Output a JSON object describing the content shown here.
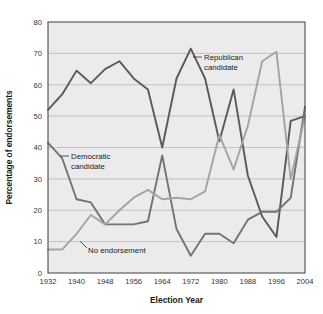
{
  "chart_data": {
    "type": "line",
    "title": "",
    "xlabel": "Election Year",
    "ylabel": "Percentage of endorsements",
    "xlim": [
      1932,
      2004
    ],
    "ylim": [
      0,
      80
    ],
    "grid": true,
    "legend_position": "inline-annotations",
    "x": [
      1932,
      1936,
      1940,
      1944,
      1948,
      1952,
      1956,
      1960,
      1964,
      1968,
      1972,
      1976,
      1980,
      1984,
      1988,
      1992,
      1996,
      2000,
      2004
    ],
    "xticks": [
      1932,
      1940,
      1948,
      1956,
      1964,
      1972,
      1980,
      1988,
      1996,
      2004
    ],
    "yticks": [
      0,
      10,
      20,
      30,
      40,
      50,
      60,
      70,
      80
    ],
    "series": [
      {
        "name": "Republican candidate",
        "color": "#595959",
        "values": [
          52,
          57,
          64.5,
          60.5,
          65,
          67.5,
          62,
          58.5,
          40,
          62,
          71.5,
          62,
          42,
          58.5,
          31,
          18,
          11.5,
          48.5,
          50
        ]
      },
      {
        "name": "Democratic candidate",
        "color": "#737373",
        "values": [
          41.5,
          36.5,
          23.5,
          22.5,
          15.5,
          15.5,
          15.5,
          16.5,
          37.5,
          14,
          5.5,
          12.5,
          12.5,
          9.5,
          17,
          19.5,
          19.5,
          24,
          53
        ]
      },
      {
        "name": "No endorsement",
        "color": "#a3a3a3",
        "values": [
          7.5,
          7.5,
          12.5,
          18.5,
          15.5,
          20,
          24,
          26.5,
          23.5,
          24,
          23.5,
          26,
          44,
          33,
          47,
          67.5,
          70.5,
          30,
          50
        ]
      }
    ],
    "annotations": [
      {
        "id": "republican-annotation",
        "lines": [
          "Republican",
          "candidate"
        ],
        "text_x": 204,
        "text_y": 57,
        "leader": {
          "x1": 193,
          "y1": 57,
          "x2": 202,
          "y2": 57
        }
      },
      {
        "id": "democratic-annotation",
        "lines": [
          "Democratic",
          "candidate"
        ],
        "text_x": 71,
        "text_y": 156,
        "leader": {
          "x1": 60,
          "y1": 156,
          "x2": 69,
          "y2": 156
        }
      },
      {
        "id": "no-endorsement-annotation",
        "lines": [
          "No endorsement"
        ],
        "text_x": 88,
        "text_y": 250,
        "leader": {
          "x1": 80,
          "y1": 241,
          "x2": 87,
          "y2": 248
        }
      }
    ]
  },
  "plot": {
    "left": 48,
    "top": 22,
    "right": 305,
    "bottom": 273
  },
  "colors": {
    "background": "#ffffff",
    "plot_background": "#ebebeb",
    "gridline": "#a8a8a8",
    "border": "#4d4d4d",
    "text": "#1a1a1a"
  }
}
